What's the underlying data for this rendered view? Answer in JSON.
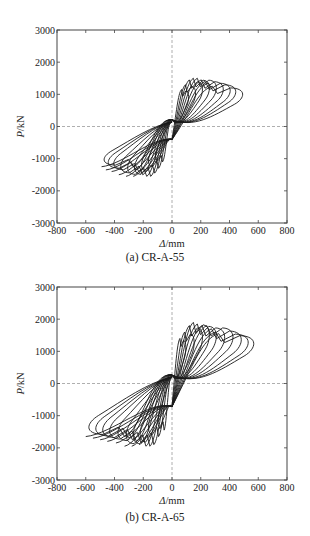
{
  "chart_data": [
    {
      "type": "line",
      "subtype": "hysteresis",
      "title": "(a) CR-A-55",
      "xlabel": "Δ/mm",
      "ylabel": "P/kN",
      "xlim": [
        -800,
        800
      ],
      "ylim": [
        -3000,
        3000
      ],
      "xticks": [
        -800,
        -600,
        -400,
        -200,
        0,
        200,
        400,
        600,
        800
      ],
      "yticks": [
        -3000,
        -2000,
        -1000,
        0,
        1000,
        2000,
        3000
      ],
      "grid": false,
      "reference_lines": "dashed lines at x=0 and y=0",
      "series": [
        {
          "name": "hysteresis loops",
          "cycles": [
            {
              "disp_max": 120,
              "load_max": 1150,
              "disp_min": -120,
              "load_min": -1100
            },
            {
              "disp_max": 170,
              "load_max": 1300,
              "disp_min": -170,
              "load_min": -1300
            },
            {
              "disp_max": 220,
              "load_max": 1450,
              "disp_min": -220,
              "load_min": -1450
            },
            {
              "disp_max": 270,
              "load_max": 1500,
              "disp_min": -270,
              "load_min": -1550
            },
            {
              "disp_max": 320,
              "load_max": 1500,
              "disp_min": -320,
              "load_min": -1550
            },
            {
              "disp_max": 370,
              "load_max": 1450,
              "disp_min": -370,
              "load_min": -1500
            },
            {
              "disp_max": 420,
              "load_max": 1400,
              "disp_min": -420,
              "load_min": -1400
            },
            {
              "disp_max": 460,
              "load_max": 1350,
              "disp_min": -460,
              "load_min": -1350
            },
            {
              "disp_max": 510,
              "load_max": 1250,
              "disp_min": -490,
              "load_min": -1250
            }
          ],
          "zero_disp_intercepts": [
            500,
            -450
          ]
        }
      ]
    },
    {
      "type": "line",
      "subtype": "hysteresis",
      "title": "(b) CR-A-65",
      "xlabel": "Δ/mm",
      "ylabel": "P/kN",
      "xlim": [
        -800,
        800
      ],
      "ylim": [
        -3000,
        3000
      ],
      "xticks": [
        -800,
        -600,
        -400,
        -200,
        0,
        200,
        400,
        600,
        800
      ],
      "yticks": [
        -3000,
        -2000,
        -1000,
        0,
        1000,
        2000,
        3000
      ],
      "grid": false,
      "reference_lines": "dashed lines at x=0 and y=0",
      "series": [
        {
          "name": "hysteresis loops",
          "cycles": [
            {
              "disp_max": 100,
              "load_max": 1400,
              "disp_min": -100,
              "load_min": -1450
            },
            {
              "disp_max": 160,
              "load_max": 1600,
              "disp_min": -170,
              "load_min": -1650
            },
            {
              "disp_max": 220,
              "load_max": 1800,
              "disp_min": -230,
              "load_min": -1900
            },
            {
              "disp_max": 270,
              "load_max": 1900,
              "disp_min": -280,
              "load_min": -1950
            },
            {
              "disp_max": 320,
              "load_max": 1850,
              "disp_min": -330,
              "load_min": -1950
            },
            {
              "disp_max": 380,
              "load_max": 1800,
              "disp_min": -390,
              "load_min": -1850
            },
            {
              "disp_max": 440,
              "load_max": 1800,
              "disp_min": -450,
              "load_min": -1800
            },
            {
              "disp_max": 500,
              "load_max": 1700,
              "disp_min": -500,
              "load_min": -1750
            },
            {
              "disp_max": 550,
              "load_max": 1600,
              "disp_min": -550,
              "load_min": -1700
            },
            {
              "disp_max": 590,
              "load_max": 1550,
              "disp_min": -600,
              "load_min": -1650
            }
          ],
          "zero_disp_intercepts": [
            700,
            -800
          ]
        }
      ]
    }
  ],
  "panels": [
    {
      "caption": "(a) CR-A-55",
      "xlabel_italic": "Δ",
      "xlabel_unit": "/mm",
      "ylabel_italic": "P",
      "ylabel_unit": "/kN",
      "xtick_labels": [
        "-800",
        "-600",
        "-400",
        "-200",
        "0",
        "200",
        "400",
        "600",
        "800"
      ],
      "ytick_labels": [
        "3000",
        "2000",
        "1000",
        "0",
        "-1000",
        "-2000",
        "-3000"
      ]
    },
    {
      "caption": "(b) CR-A-65",
      "xlabel_italic": "Δ",
      "xlabel_unit": "/mm",
      "ylabel_italic": "P",
      "ylabel_unit": "/kN",
      "xtick_labels": [
        "-800",
        "-600",
        "-400",
        "-200",
        "0",
        "200",
        "400",
        "600",
        "800"
      ],
      "ytick_labels": [
        "3000",
        "2000",
        "1000",
        "0",
        "-1000",
        "-2000",
        "-3000"
      ]
    }
  ],
  "colors": {
    "curve": "#1a1a1a",
    "axis": "#444444",
    "reference": "#9a9a9a",
    "text": "#222222"
  }
}
